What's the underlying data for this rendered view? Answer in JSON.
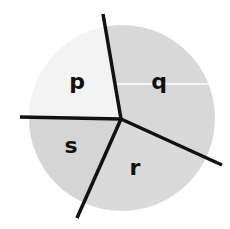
{
  "diagram": {
    "type": "circle-divided-into-regions",
    "regions": [
      {
        "label": "p",
        "fill": "#f2f2f2"
      },
      {
        "label": "q",
        "fill": "#d9d9d9"
      },
      {
        "label": "r",
        "fill": "#dcdcdc"
      },
      {
        "label": "s",
        "fill": "#d6d6d6"
      }
    ],
    "colors": {
      "line": "#111111",
      "divider": "#ffffff",
      "background": "#ffffff"
    }
  }
}
